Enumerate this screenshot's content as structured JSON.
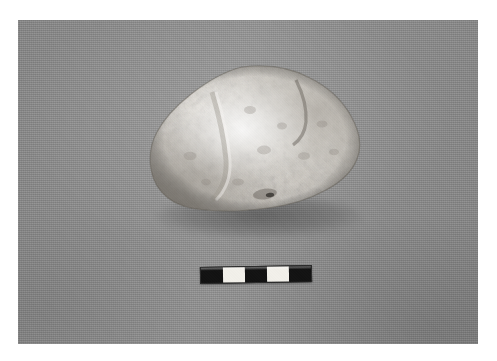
{
  "figure": {
    "domain_label": "archaeological-artifact-photograph",
    "caption": "",
    "canvas": {
      "width": 497,
      "height": 361,
      "background_color": "#ffffff"
    }
  },
  "plate": {
    "name": "photographic plate",
    "backdrop_material": "grey woven cloth",
    "backdrop_color": "#8d8d8d",
    "left": 18,
    "top": 20,
    "width": 460,
    "height": 324
  },
  "artifact": {
    "name": "stone artifact",
    "description": "rounded weathered chalk/limestone cobble",
    "surface": "knobbly, pitted, mottled",
    "highlight_color": "#f4f2ee",
    "midtone_color": "#cfcbc4",
    "shadow_color": "#8a867f",
    "left": 146,
    "top": 64,
    "width": 218,
    "height": 150,
    "label": ""
  },
  "scale_bar": {
    "name": "photographic scale bar",
    "left": 200,
    "top": 266,
    "width": 112,
    "height": 17,
    "segment_count": 5,
    "segments": [
      "dark",
      "light",
      "dark",
      "light",
      "dark"
    ],
    "dark_color": "#121212",
    "light_color": "#f2f0ea",
    "tick_labels": [],
    "units_label": ""
  }
}
